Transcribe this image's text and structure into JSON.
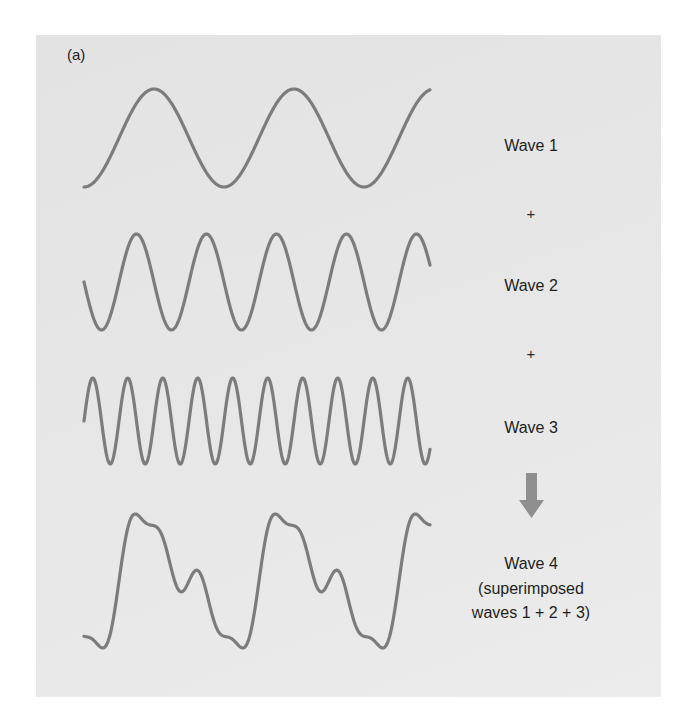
{
  "figure": {
    "panel_label": "(a)",
    "background_color": "#e6e6e6",
    "wave_color": "#7c7c7c",
    "arrow_color": "#8f8f8f"
  },
  "waves": [
    {
      "id": "wave1",
      "label": "Wave 1",
      "cycles": 2.5
    },
    {
      "id": "wave2",
      "label": "Wave 2",
      "cycles": 5
    },
    {
      "id": "wave3",
      "label": "Wave 3",
      "cycles": 10
    },
    {
      "id": "wave4",
      "label": "Wave 4",
      "sublabel_line1": "(superimposed",
      "sublabel_line2": "waves 1 + 2 + 3)"
    }
  ],
  "operators": {
    "plus1": "+",
    "plus2": "+",
    "result_arrow": "down-arrow-icon"
  },
  "chart_data": {
    "type": "line",
    "title": "(a)",
    "xlabel": "",
    "ylabel": "",
    "grid": false,
    "series": [
      {
        "name": "Wave 1",
        "relative_frequency": 1,
        "cycles_shown": 2.5,
        "shape": "sinusoid"
      },
      {
        "name": "Wave 2",
        "relative_frequency": 2,
        "cycles_shown": 5,
        "shape": "sinusoid"
      },
      {
        "name": "Wave 3",
        "relative_frequency": 4,
        "cycles_shown": 10,
        "shape": "sinusoid"
      },
      {
        "name": "Wave 4 (superimposed waves 1 + 2 + 3)",
        "shape": "sum of waves 1, 2 and 3"
      }
    ]
  }
}
